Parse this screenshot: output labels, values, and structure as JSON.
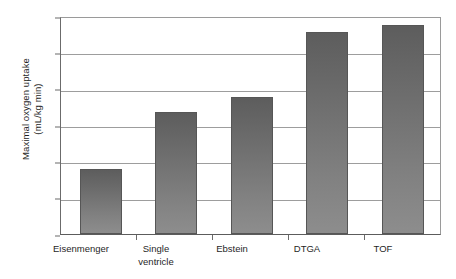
{
  "chart_data": {
    "type": "bar",
    "title": "",
    "subtitle": "",
    "xlabel": "",
    "ylabel": "Maximal oxygen uptake (mL/kg min)",
    "ylabel_lines": [
      "Maximal oxygen uptake",
      "(mL/kg min)"
    ],
    "categories": [
      "Eisenmenger",
      "Single ventricle",
      "Ebstein",
      "DTGA",
      "TOF"
    ],
    "category_lines": [
      [
        "Eisenmenger"
      ],
      [
        "Single",
        "ventricle"
      ],
      [
        "Ebstein"
      ],
      [
        "DTGA"
      ],
      [
        "TOF"
      ]
    ],
    "values": [
      9,
      17,
      19,
      28,
      29
    ],
    "ylim": [
      0,
      30
    ],
    "ytick_values": [
      0,
      5,
      10,
      15,
      20,
      25,
      30
    ],
    "ytick_labels": [
      "0",
      "5",
      "10",
      "15",
      "20",
      "25",
      "30"
    ],
    "grid": true,
    "grid_axis": "y",
    "legend": "none",
    "bar_color_top": "#5d5d5d",
    "bar_color_bottom": "#8d8d8d",
    "bar_border_color": "#565656",
    "gridline_color": "#9d9d9d",
    "axis_color": "#5c5c5c",
    "background_color": "#ffffff",
    "text_color": "#1f1f1f"
  }
}
